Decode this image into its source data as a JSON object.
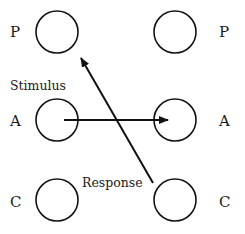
{
  "diagram": {
    "left_column": {
      "rows": [
        {
          "label": "P"
        },
        {
          "label": "A"
        },
        {
          "label": "C"
        }
      ]
    },
    "right_column": {
      "rows": [
        {
          "label": "P"
        },
        {
          "label": "A"
        },
        {
          "label": "C"
        }
      ]
    },
    "annotations": {
      "stimulus": "Stimulus",
      "response": "Response"
    },
    "arrows": [
      {
        "name": "stimulus-arrow",
        "from": "left A",
        "to": "right A"
      },
      {
        "name": "response-arrow",
        "from": "right C",
        "to": "left P"
      }
    ],
    "colors": {
      "stroke": "#111111",
      "text": "#1a1a1a",
      "background": "#ffffff"
    }
  }
}
